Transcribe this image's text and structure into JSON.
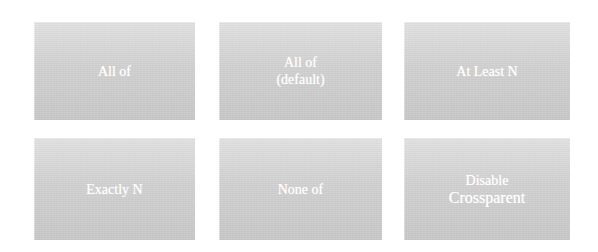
{
  "tiles": [
    {
      "label": "All of",
      "row": 1,
      "col": 1
    },
    {
      "label_line1": "All of",
      "label_line2": "(default)",
      "row": 1,
      "col": 2
    },
    {
      "label": "At Least N",
      "row": 1,
      "col": 3
    },
    {
      "label": "Exactly N",
      "row": 2,
      "col": 1
    },
    {
      "label": "None of",
      "row": 2,
      "col": 2
    },
    {
      "label_line1": "Disable",
      "label_line2": "Crossparent",
      "row": 2,
      "col": 3
    }
  ],
  "colors": {
    "tile_top": "#e2e2e2",
    "tile_bottom": "#c9c9c9",
    "text": "#ffffff",
    "background": "#ffffff"
  }
}
